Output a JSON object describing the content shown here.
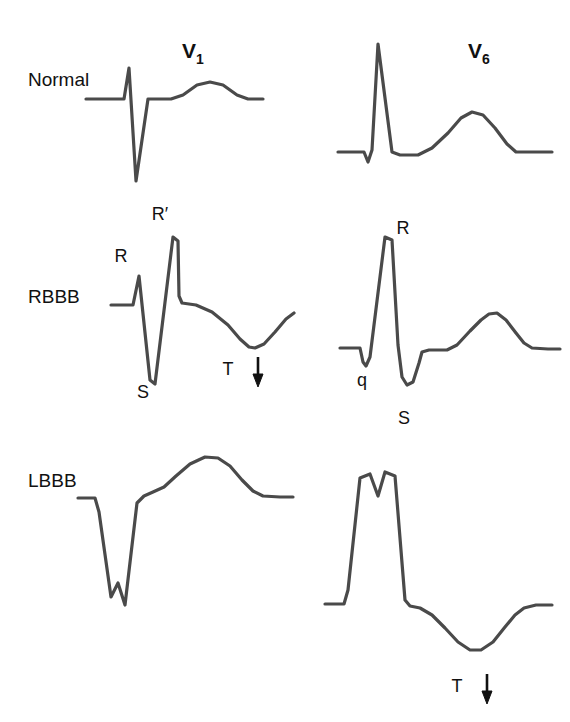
{
  "figure": {
    "stroke_color": "#4a4a4a",
    "stroke_width": 3.2,
    "text_color": "#111111",
    "background": "#ffffff"
  },
  "columns": [
    {
      "id": "v1",
      "letter": "V",
      "subscript": "1",
      "x": 182,
      "y": 58
    },
    {
      "id": "v6",
      "letter": "V",
      "subscript": "6",
      "x": 468,
      "y": 58
    }
  ],
  "rows": [
    {
      "id": "normal",
      "label": "Normal",
      "x": 28,
      "y": 86
    },
    {
      "id": "rbbb",
      "label": "RBBB",
      "x": 28,
      "y": 303
    },
    {
      "id": "lbbb",
      "label": "LBBB",
      "x": 28,
      "y": 487
    }
  ],
  "annotations": [
    {
      "id": "rbbb-v1-r",
      "text": "R",
      "x": 121,
      "y": 262,
      "panel": "rbbb-v1"
    },
    {
      "id": "rbbb-v1-rp",
      "text": "R′",
      "x": 160,
      "y": 220,
      "panel": "rbbb-v1"
    },
    {
      "id": "rbbb-v1-s",
      "text": "S",
      "x": 143,
      "y": 398,
      "panel": "rbbb-v1"
    },
    {
      "id": "rbbb-v1-t",
      "text": "T",
      "x": 228,
      "y": 375,
      "panel": "rbbb-v1"
    },
    {
      "id": "rbbb-v6-r",
      "text": "R",
      "x": 403,
      "y": 234,
      "panel": "rbbb-v6"
    },
    {
      "id": "rbbb-v6-q",
      "text": "q",
      "x": 362,
      "y": 386,
      "panel": "rbbb-v6"
    },
    {
      "id": "rbbb-v6-s",
      "text": "S",
      "x": 404,
      "y": 424,
      "panel": "rbbb-v6"
    },
    {
      "id": "lbbb-v6-t",
      "text": "T",
      "x": 457,
      "y": 692,
      "panel": "lbbb-v6"
    }
  ],
  "arrows": [
    {
      "id": "rbbb-v1-t-arrow",
      "direction": "down",
      "x": 258,
      "y_top": 357,
      "y_bottom": 385
    },
    {
      "id": "lbbb-v6-t-arrow",
      "direction": "down",
      "x": 487,
      "y_top": 674,
      "y_bottom": 702
    }
  ],
  "waveforms": [
    {
      "id": "normal-v1",
      "row": "normal",
      "lead": "V1",
      "description": "rS complex with small R, deep S and upright T wave",
      "path": "M 86 99 L 124 99 L 129 68 L 136 181 L 148 99 L 171 99 L 183 95 L 197 85 L 210 82 L 223 85 L 237 95 L 248 99 L 263 99"
    },
    {
      "id": "normal-v6",
      "row": "normal",
      "lead": "V6",
      "description": "qRs complex with tall R and broad upright T wave",
      "path": "M 338 152 L 364 152 L 368 162 L 372 150 L 378 44 L 392 152 L 400 155 L 418 155 L 432 148 L 448 133 L 461 118 L 472 112 L 483 115 L 495 128 L 507 144 L 516 152 L 535 152 L 552 152"
    },
    {
      "id": "rbbb-v1",
      "row": "rbbb",
      "lead": "V1",
      "description": "rSR prime pattern with wide QRS and inverted T wave",
      "path": "M 111 305 L 133 305 L 139 276 L 150 380 L 155 384 L 173 237 L 178 241 L 179 296 L 182 303 L 196 305 L 212 312 L 228 325 L 240 339 L 249 347 L 255 348 L 264 344 L 275 332 L 286 319 L 294 313"
    },
    {
      "id": "rbbb-v6",
      "row": "rbbb",
      "lead": "V6",
      "description": "qRS pattern with slurred wide S wave and upright T wave",
      "path": "M 340 348 L 360 348 L 363 362 L 366 366 L 370 357 L 385 237 L 392 240 L 398 345 L 402 377 L 407 385 L 413 382 L 419 363 L 422 352 L 429 350 L 447 350 L 457 345 L 470 331 L 481 320 L 489 314 L 497 313 L 506 320 L 516 333 L 524 343 L 532 348 L 548 349 L 560 349"
    },
    {
      "id": "lbbb-v1",
      "row": "lbbb",
      "lead": "V1",
      "description": "wide notched QS complex with broad upright T wave",
      "path": "M 78 498 L 95 498 L 99 512 L 111 597 L 118 583 L 125 605 L 137 503 L 144 496 L 153 492 L 164 487 L 176 476 L 190 464 L 205 457 L 218 458 L 230 466 L 242 480 L 253 491 L 263 496 L 280 497 L 293 497"
    },
    {
      "id": "lbbb-v6",
      "row": "lbbb",
      "lead": "V6",
      "description": "wide notched M-shaped R wave with inverted T wave",
      "path": "M 325 604 L 344 604 L 348 590 L 360 478 L 370 474 L 378 496 L 385 472 L 395 476 L 405 600 L 410 606 L 420 608 L 432 615 L 445 628 L 458 642 L 470 650 L 481 650 L 493 642 L 505 627 L 515 615 L 524 608 L 536 605 L 552 605"
    }
  ]
}
